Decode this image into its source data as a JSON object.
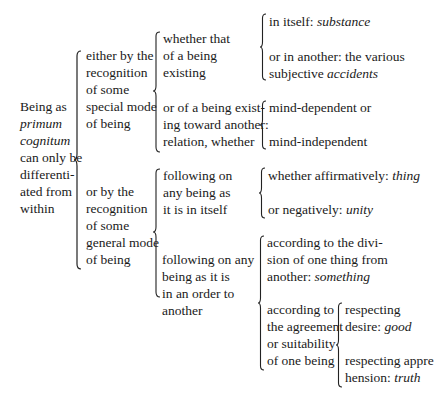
{
  "root": {
    "lines": [
      "Being as",
      "primum",
      "cognitum",
      "can only be",
      "differenti-",
      "ated from",
      "within"
    ],
    "italic_lines": [
      1,
      2
    ]
  },
  "branch_special": {
    "lines": [
      "either by the",
      "recognition",
      "of some",
      "special mode",
      "of being"
    ],
    "sub_existing": {
      "lines": [
        "whether that",
        "of a being",
        "existing"
      ],
      "in_itself": {
        "prefix": "in itself: ",
        "term": "substance"
      },
      "in_another": {
        "line1": "or in another: the various",
        "prefix2": "subjective ",
        "term": "accidents"
      }
    },
    "sub_relation": {
      "lines": [
        "or of a being exist-",
        "ing toward another:",
        "relation, whether"
      ],
      "mind_dependent": "mind-dependent or",
      "mind_independent": "mind-independent"
    }
  },
  "branch_general": {
    "lines": [
      "or by the",
      "recognition",
      "of some",
      "general mode",
      "of being"
    ],
    "sub_itself": {
      "lines": [
        "following on",
        "any being as",
        "it is in itself"
      ],
      "affirm": {
        "prefix": "whether affirmatively: ",
        "term": "thing"
      },
      "negat": {
        "prefix": "or negatively: ",
        "term": "unity"
      }
    },
    "sub_order": {
      "lines": [
        "following on any",
        "being as it is",
        "in an order to",
        "another"
      ],
      "division": {
        "line1": "according to the divi-",
        "line2": "sion of one thing from",
        "prefix3": "another: ",
        "term": "something"
      },
      "agreement": {
        "lines": [
          "according to",
          "the agreement",
          "or suitability",
          "of one being"
        ],
        "desire": {
          "line1": "respecting",
          "prefix2": "desire: ",
          "term": "good"
        },
        "apprehension": {
          "line1": "respecting appre",
          "prefix2": "hension: ",
          "term": "truth"
        }
      }
    }
  }
}
